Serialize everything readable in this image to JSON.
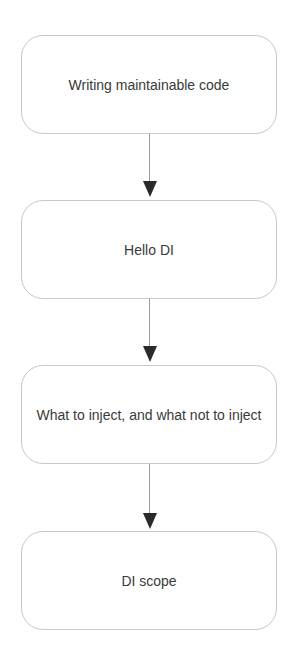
{
  "diagram": {
    "type": "flowchart",
    "direction": "top-to-bottom",
    "nodes": [
      {
        "id": "n1",
        "label": "Writing maintainable code"
      },
      {
        "id": "n2",
        "label": "Hello DI"
      },
      {
        "id": "n3",
        "label": "What to inject, and what not to inject"
      },
      {
        "id": "n4",
        "label": "DI scope"
      }
    ],
    "edges": [
      {
        "from": "n1",
        "to": "n2"
      },
      {
        "from": "n2",
        "to": "n3"
      },
      {
        "from": "n3",
        "to": "n4"
      }
    ]
  }
}
